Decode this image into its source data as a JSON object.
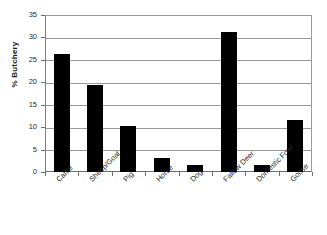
{
  "chart_data": {
    "type": "bar",
    "title": "",
    "xlabel": "",
    "ylabel": "% Butchery",
    "categories": [
      "Cattle",
      "Sheep/Goat",
      "Pig",
      "Horse",
      "Dog",
      "Fallow Deer",
      "Domestic Fowl",
      "Goose"
    ],
    "values": [
      26.3,
      19.5,
      10.2,
      3.1,
      1.5,
      31.2,
      1.5,
      11.7
    ],
    "ylim": [
      0,
      35
    ],
    "y_ticks": [
      0,
      5,
      10,
      15,
      20,
      25,
      30,
      35
    ],
    "y_tick_labels": [
      "0",
      "5",
      "10",
      "15",
      "20",
      "25",
      "30",
      "35"
    ],
    "grid": true,
    "grid_axis": "y",
    "legend": false,
    "bar_color": "#000000",
    "grid_color": "#9a9a9a",
    "axis_color": "#6e6e6e",
    "background_color": "#ffffff",
    "x_tick_label_rotation": -45
  }
}
